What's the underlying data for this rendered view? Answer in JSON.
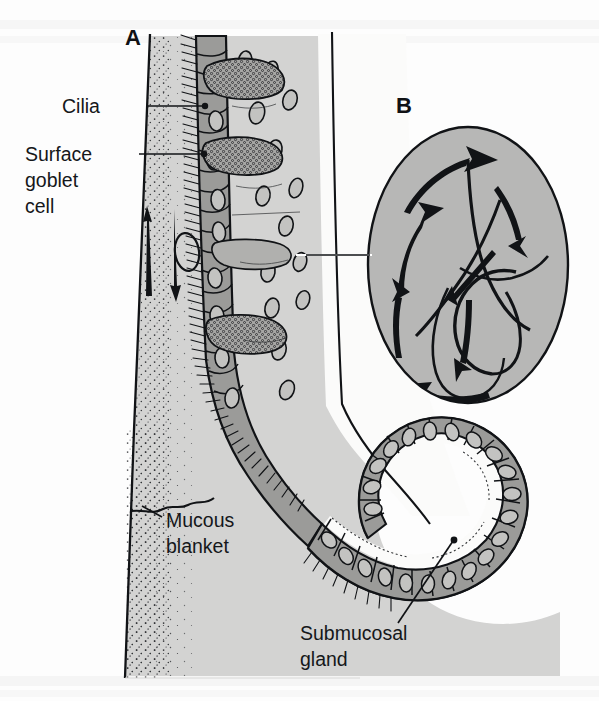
{
  "figure": {
    "background_color": "#fdfdfd"
  },
  "panels": [
    {
      "letter": "A",
      "name": "pseudostratified-ciliated-epithelium-cross-section",
      "x": 125,
      "y": 45
    },
    {
      "letter": "B",
      "name": "ciliary-beat-cycle-detail",
      "x": 396,
      "y": 113
    }
  ],
  "labels": [
    {
      "id": "cilia",
      "lines": [
        "Cilia"
      ],
      "text_x": 62,
      "text_y": 113,
      "anchor": "start",
      "leader": "M 146 106 L 204 106",
      "dot": {
        "cx": 205,
        "cy": 106,
        "r": 3.2
      }
    },
    {
      "id": "surface-goblet-cell",
      "lines": [
        "Surface",
        "goblet",
        "cell"
      ],
      "text_x": 25,
      "text_y": 161,
      "anchor": "start",
      "leader": "M 139 154 L 203 154",
      "dot": {
        "cx": 204,
        "cy": 154,
        "r": 3.2
      }
    },
    {
      "id": "mucous-blanket",
      "lines": [
        "Mucous",
        "blanket"
      ],
      "text_x": 165,
      "text_y": 527,
      "anchor": "start",
      "leader": "M 160 516 L 142 505",
      "dot": null
    },
    {
      "id": "submucosal-gland",
      "lines": [
        "Submucosal",
        "gland"
      ],
      "text_x": 300,
      "text_y": 640,
      "anchor": "start",
      "leader": "M 398 623 L 453 541",
      "dot": {
        "cx": 454,
        "cy": 540,
        "r": 3.4
      }
    }
  ],
  "colors": {
    "mucous_layer": "#d3d3d2",
    "epithelium_cell": "#9b9b99",
    "gland_cell": "#9b9b99",
    "panel_b_fill": "#b7b7b6",
    "outline": "#111316",
    "lumen": "#fbfbfa",
    "basement_membrane": "#e8e8e7",
    "text": "#15171a",
    "stipple": "#2a2c2f"
  },
  "annotations": {
    "mucus_flow_up_arrow": "upward mucus transport in mucous blanket",
    "mucus_flow_down_arrow": "downward mucus transport in mucous blanket",
    "panel_b_arrows": "curved arrows showing ciliary effective and recovery stroke",
    "panel_b_connector": "white leader line linking panel A epithelium to panel B detail"
  },
  "structures": {
    "airway_lumen_label": "airway lumen",
    "epithelium_label": "pseudostratified columnar ciliated epithelium",
    "goblet_cells_count": 4,
    "gland_acinus_label": "submucosal gland acinus"
  },
  "scan_bleed_text": {
    "top": "faint show-through text from reverse page",
    "bottom": "faint show-through text from reverse page"
  }
}
